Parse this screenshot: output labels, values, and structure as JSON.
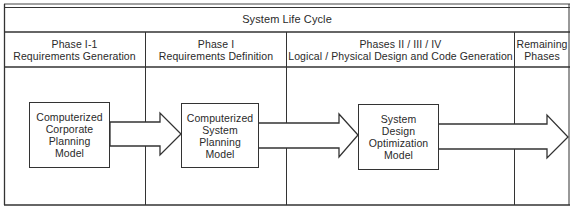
{
  "title": "System Life Cycle",
  "phases": [
    {
      "line1": "Phase I-1",
      "line2": "Requirements Generation"
    },
    {
      "line1": "Phase I",
      "line2": "Requirements Definition"
    },
    {
      "line1": "Phases II / III / IV",
      "line2": "Logical / Physical Design and Code Generation"
    },
    {
      "line1": "Remaining",
      "line2": "Phases"
    }
  ],
  "models": [
    {
      "lines": [
        "Computerized",
        "Corporate",
        "Planning",
        "Model"
      ]
    },
    {
      "lines": [
        "Computerized",
        "System",
        "Planning",
        "Model"
      ]
    },
    {
      "lines": [
        "System",
        "Design",
        "Optimization",
        "Model"
      ]
    }
  ],
  "colors": {
    "line": "#333333",
    "text": "#2a2a2a",
    "background": "#ffffff"
  }
}
